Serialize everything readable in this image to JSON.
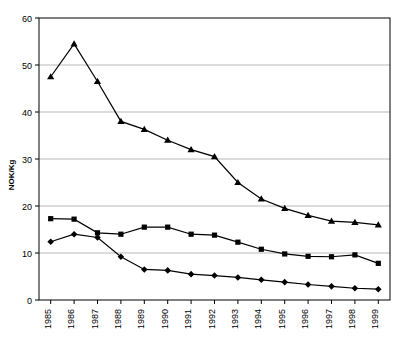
{
  "chart_data": {
    "type": "line",
    "title": "",
    "xlabel": "",
    "ylabel": "NOK/Kg",
    "categories": [
      "1985",
      "1986",
      "1987",
      "1988",
      "1989",
      "1990",
      "1991",
      "1992",
      "1993",
      "1994",
      "1995",
      "1996",
      "1997",
      "1998",
      "1999"
    ],
    "ylim": [
      0,
      60
    ],
    "yticks": [
      0,
      10,
      20,
      30,
      40,
      50,
      60
    ],
    "grid": true,
    "legend_position": "top-cropped",
    "series": [
      {
        "name": "series-triangle",
        "marker": "triangle",
        "color": "#000000",
        "values": [
          47.5,
          54.5,
          46.5,
          38.0,
          36.3,
          34.0,
          32.0,
          30.5,
          25.0,
          21.5,
          19.5,
          18.0,
          16.8,
          16.5,
          16.0
        ]
      },
      {
        "name": "series-square",
        "marker": "square",
        "color": "#000000",
        "values": [
          17.3,
          17.2,
          14.3,
          14.0,
          15.5,
          15.5,
          14.0,
          13.8,
          12.3,
          10.8,
          9.8,
          9.3,
          9.2,
          9.6,
          7.8
        ]
      },
      {
        "name": "series-diamond",
        "marker": "diamond",
        "color": "#000000",
        "values": [
          12.4,
          14.0,
          13.3,
          9.2,
          6.5,
          6.3,
          5.5,
          5.2,
          4.8,
          4.3,
          3.8,
          3.3,
          2.9,
          2.5,
          2.3
        ]
      }
    ]
  },
  "axis": {
    "y_title": "NOK/Kg",
    "y_tick_labels": [
      "60",
      "50",
      "40",
      "30",
      "20",
      "10",
      "0"
    ],
    "x_tick_labels": [
      "1985",
      "1986",
      "1987",
      "1988",
      "1989",
      "1990",
      "1991",
      "1992",
      "1993",
      "1994",
      "1995",
      "1996",
      "1997",
      "1998",
      "1999"
    ]
  },
  "legend_cropped": {
    "note": "",
    "items": [
      "",
      "",
      "",
      ""
    ]
  }
}
